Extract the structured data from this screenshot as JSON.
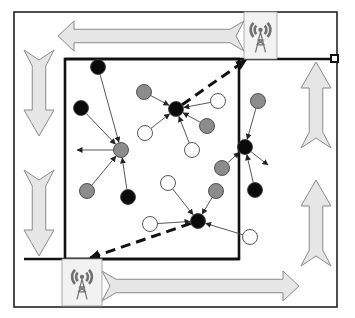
{
  "diagram": {
    "colors": {
      "background": "#ffffff",
      "border": "#222222",
      "arrow_fill": "#e6e6e6",
      "arrow_stroke": "#8a8a8a",
      "node_black": "#0a0a0a",
      "node_gray": "#8c8c8c",
      "node_white": "#ffffff",
      "node_stroke": "#444444",
      "edge": "#444444",
      "tower": "#707070",
      "tower_box": "#f2f2f2"
    },
    "outer_frame": {
      "x": 14,
      "y": 12,
      "w": 323,
      "h": 295
    },
    "inner_field": {
      "x": 65,
      "y": 59,
      "w": 174,
      "h": 200
    },
    "path_lines": [
      {
        "name": "top-track",
        "x1": 65,
        "y1": 59,
        "x2": 334,
        "y2": 59
      },
      {
        "name": "bottom-track",
        "x1": 24,
        "y1": 259,
        "x2": 239,
        "y2": 259
      }
    ],
    "track_end_marker": {
      "x": 334,
      "y": 59
    },
    "towers": [
      {
        "name": "top-sink",
        "x": 244,
        "y": 12,
        "w": 33,
        "h": 47
      },
      {
        "name": "bottom-sink",
        "x": 62,
        "y": 259,
        "w": 40,
        "h": 47
      }
    ],
    "flow_arrows": [
      {
        "name": "top-left-arrow",
        "dir": "left",
        "x1": 58,
        "x2": 244,
        "cy": 36,
        "h": 30
      },
      {
        "name": "bottom-right-arrow",
        "dir": "right",
        "x1": 102,
        "x2": 299,
        "cy": 286,
        "h": 30
      },
      {
        "name": "left-upper-arrow",
        "dir": "down",
        "cx": 39,
        "y1": 50,
        "y2": 136,
        "w": 30
      },
      {
        "name": "left-lower-arrow",
        "dir": "down",
        "cx": 39,
        "y1": 170,
        "y2": 256,
        "w": 30
      },
      {
        "name": "right-upper-arrow",
        "dir": "up",
        "cx": 316,
        "y1": 62,
        "y2": 148,
        "w": 30
      },
      {
        "name": "right-lower-arrow",
        "dir": "up",
        "cx": 316,
        "y1": 180,
        "y2": 266,
        "w": 30
      }
    ],
    "nodes": [
      {
        "id": "b1",
        "type": "black",
        "x": 98,
        "y": 67
      },
      {
        "id": "b2",
        "type": "black",
        "x": 81,
        "y": 108
      },
      {
        "id": "g1",
        "type": "gray",
        "x": 144,
        "y": 92
      },
      {
        "id": "ch1",
        "type": "black",
        "x": 176,
        "y": 109
      },
      {
        "id": "w1",
        "type": "white",
        "x": 145,
        "y": 133
      },
      {
        "id": "g_ch2",
        "type": "gray",
        "x": 121,
        "y": 150
      },
      {
        "id": "w2",
        "type": "white",
        "x": 218,
        "y": 101
      },
      {
        "id": "g2",
        "type": "gray",
        "x": 207,
        "y": 126
      },
      {
        "id": "g3",
        "type": "gray",
        "x": 258,
        "y": 101
      },
      {
        "id": "w3",
        "type": "white",
        "x": 192,
        "y": 150
      },
      {
        "id": "ch3",
        "type": "black",
        "x": 245,
        "y": 147
      },
      {
        "id": "g4",
        "type": "gray",
        "x": 222,
        "y": 168
      },
      {
        "id": "g5",
        "type": "gray",
        "x": 87,
        "y": 191
      },
      {
        "id": "b3",
        "type": "black",
        "x": 128,
        "y": 197
      },
      {
        "id": "w4",
        "type": "white",
        "x": 168,
        "y": 183
      },
      {
        "id": "g6",
        "type": "gray",
        "x": 216,
        "y": 191
      },
      {
        "id": "b4",
        "type": "black",
        "x": 255,
        "y": 190
      },
      {
        "id": "w5",
        "type": "white",
        "x": 150,
        "y": 224
      },
      {
        "id": "w6",
        "type": "white",
        "x": 250,
        "y": 237
      },
      {
        "id": "ch4",
        "type": "black",
        "x": 198,
        "y": 221
      }
    ],
    "edges": [
      {
        "from": "b1",
        "to": "g_ch2"
      },
      {
        "from": "b2",
        "to": "g_ch2"
      },
      {
        "from": "g5",
        "to": "g_ch2"
      },
      {
        "from": "b3",
        "to": "g_ch2"
      },
      {
        "from": "g1",
        "to": "ch1"
      },
      {
        "from": "w1",
        "to": "ch1"
      },
      {
        "from": "w2",
        "to": "ch1"
      },
      {
        "from": "g2",
        "to": "ch1"
      },
      {
        "from": "w3",
        "to": "ch1"
      },
      {
        "from": "g3",
        "to": "ch3"
      },
      {
        "from": "g4",
        "to": "ch3"
      },
      {
        "from": "b4",
        "to": "ch3"
      },
      {
        "from": "w4",
        "to": "ch4"
      },
      {
        "from": "g6",
        "to": "ch4"
      },
      {
        "from": "w5",
        "to": "ch4"
      },
      {
        "from": "w6",
        "to": "ch4"
      }
    ],
    "outgoing_arrows": [
      {
        "from": "g_ch2",
        "x2": 77,
        "y2": 150
      },
      {
        "from": "ch3",
        "x2": 268,
        "y2": 165
      }
    ],
    "sink_uploads": [
      {
        "from": "ch1",
        "x2": 246,
        "y2": 60
      },
      {
        "from": "ch4",
        "x2": 90,
        "y2": 258
      }
    ],
    "legend_labels": {
      "black": "cluster head / sensor (black)",
      "gray": "sensor (gray)",
      "white": "sensor (white)",
      "tower": "mobile sink"
    }
  }
}
